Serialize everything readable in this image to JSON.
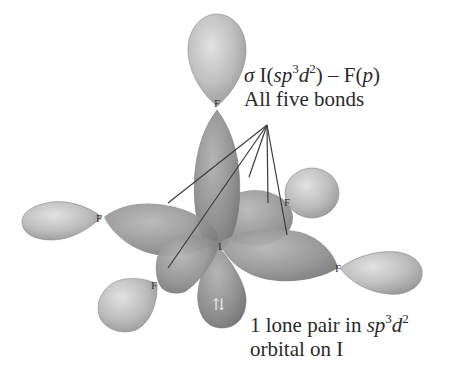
{
  "figure": {
    "central_atom": "I",
    "ligand_atom": "F",
    "lone_pair_symbol": "⇅",
    "colors": {
      "lobe_light": "#cfcfcf",
      "lobe_dark": "#8e8e8e",
      "line": "#444444",
      "text": "#2a2a2a"
    }
  },
  "labels": {
    "bond": {
      "sigma": "σ",
      "line1_prefix": "I(",
      "sp": "sp",
      "sup1": "3",
      "d": "d",
      "sup2": "2",
      "line1_mid": ") – F(",
      "p": "p",
      "line1_suffix": ")",
      "line2": "All five bonds"
    },
    "lone_pair": {
      "line1_prefix": "1 lone pair in ",
      "sp": "sp",
      "sup1": "3",
      "d": "d",
      "sup2": "2",
      "line2": "orbital on I"
    }
  }
}
